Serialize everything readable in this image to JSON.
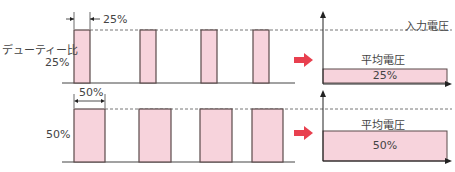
{
  "colors": {
    "pulse_fill": "#f7d3dc",
    "pulse_stroke": "#5a4a4a",
    "arrow_red": "#e8404f",
    "axis": "#222222",
    "dash": "#777777"
  },
  "top_row": {
    "duty_label": "デューティー比",
    "duty_value": "25%",
    "width_annotation": "25%",
    "input_voltage_label": "入力電圧",
    "average_voltage_label": "平均電圧",
    "average_value": "25%"
  },
  "bottom_row": {
    "duty_value": "50%",
    "width_annotation": "50%",
    "average_voltage_label": "平均電圧",
    "average_value": "50%"
  },
  "icons": {
    "conversion_arrow": "right-arrow"
  }
}
